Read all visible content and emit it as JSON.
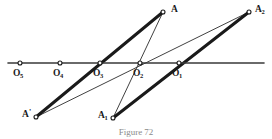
{
  "figure": {
    "caption": "Figure 72",
    "axis": {
      "name": "horizontal-axis-line",
      "x1": 8,
      "y1": 63,
      "x2": 264,
      "y2": 63,
      "color": "#3a3a3a"
    },
    "colors": {
      "ink": "#1a1a1a",
      "axis": "#3a3a3a",
      "thin_line": "#2b2b2b",
      "caption": "#8a8a8a",
      "background": "#ffffff"
    },
    "points": [
      {
        "id": "O5",
        "label": "O",
        "sub": "5",
        "x": 20,
        "y": 63,
        "label_x": 13,
        "label_y": 69
      },
      {
        "id": "O4",
        "label": "O",
        "sub": "4",
        "x": 60,
        "y": 63,
        "label_x": 53,
        "label_y": 69
      },
      {
        "id": "O3",
        "label": "O",
        "sub": "3",
        "x": 100,
        "y": 63,
        "label_x": 93,
        "label_y": 69
      },
      {
        "id": "O2",
        "label": "O",
        "sub": "2",
        "x": 140,
        "y": 63,
        "label_x": 133,
        "label_y": 69
      },
      {
        "id": "O1",
        "label": "O",
        "sub": "1",
        "x": 179,
        "y": 63,
        "label_x": 172,
        "label_y": 69
      },
      {
        "id": "A",
        "label": "A",
        "sub": "",
        "x": 163,
        "y": 12,
        "label_x": 171,
        "label_y": 5
      },
      {
        "id": "A2",
        "label": "A",
        "sub": "2",
        "x": 249,
        "y": 12,
        "label_x": 255,
        "label_y": 5
      },
      {
        "id": "Aprime",
        "label": "A",
        "sup": "'",
        "sub": "",
        "x": 36,
        "y": 117,
        "label_x": 22,
        "label_y": 110
      },
      {
        "id": "A1",
        "label": "A",
        "sub": "1",
        "x": 113,
        "y": 118,
        "label_x": 98,
        "label_y": 111
      }
    ],
    "thick_segments": [
      {
        "name": "segment-Aprime-to-A",
        "from": "Aprime",
        "to": "A",
        "x1": 36,
        "y1": 117,
        "x2": 163,
        "y2": 12,
        "width": 3.0
      },
      {
        "name": "segment-A1-to-A2",
        "from": "A1",
        "to": "A2",
        "x1": 113,
        "y1": 118,
        "x2": 249,
        "y2": 12,
        "width": 3.0
      }
    ],
    "thin_segments": [
      {
        "name": "ray-A1-through-O2-to-A",
        "from": "A1",
        "to": "A",
        "x1": 113,
        "y1": 118,
        "x2": 163,
        "y2": 12,
        "width": 0.9
      },
      {
        "name": "ray-Aprime-through-O2-to-A2",
        "from": "Aprime",
        "to": "A2",
        "x1": 36,
        "y1": 117,
        "x2": 249,
        "y2": 12,
        "width": 0.9
      }
    ],
    "node_marker": {
      "name": "open-circle-node",
      "radius": 2.0,
      "fill": "#ffffff",
      "stroke": "#1a1a1a",
      "stroke_width": 1.1
    }
  }
}
